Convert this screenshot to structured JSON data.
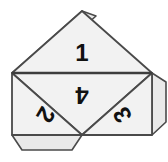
{
  "figure": {
    "name": "tetrahedron-net",
    "background_color": "#ffffff",
    "face_fill": "#f2f2f2",
    "flap_fill": "#e9e9e9",
    "stroke_color": "#4a4a4a",
    "label_color": "#111111",
    "faces": [
      {
        "id": "face-1",
        "label": "1",
        "orientation": "up",
        "label_rotation": 0,
        "points": "82,11 152,73 12,73",
        "label_x": 82,
        "label_y": 52
      },
      {
        "id": "face-4",
        "label": "4",
        "orientation": "down",
        "label_rotation": 180,
        "points": "12,73 152,73 82,135",
        "label_x": 82,
        "label_y": 95
      },
      {
        "id": "face-2",
        "label": "2",
        "orientation": "up",
        "label_rotation": 120,
        "points": "12,73 82,135 12,135",
        "label_x": 46,
        "label_y": 115
      },
      {
        "id": "face-3",
        "label": "3",
        "orientation": "up",
        "label_rotation": -120,
        "points": "152,73 152,135 82,135",
        "label_x": 122,
        "label_y": 115
      }
    ],
    "flaps": [
      {
        "id": "flap-top-left",
        "attached_to": "face-1",
        "edge": "upper-left",
        "points": "82,11 12,73 32,73 96,16"
      },
      {
        "id": "flap-bottom",
        "attached_to": "face-2",
        "edge": "bottom",
        "points": "12,135 82,135 72,150 22,150"
      },
      {
        "id": "flap-right",
        "attached_to": "face-3",
        "edge": "upper-right",
        "points": "152,73 152,135 166,122 166,82"
      }
    ]
  }
}
